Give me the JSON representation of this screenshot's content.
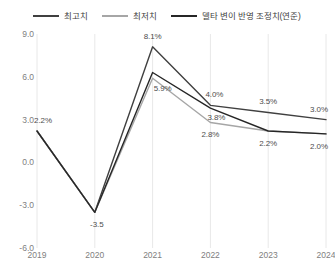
{
  "legend": {
    "position": "top-center",
    "items": [
      {
        "label": "최고치",
        "color": "#404040",
        "key": "high"
      },
      {
        "label": "최저치",
        "color": "#a6a6a6",
        "key": "low"
      },
      {
        "label": "델타 변이 반영 조정치(연준)",
        "color": "#262626",
        "key": "delta_adjusted"
      }
    ]
  },
  "axes": {
    "y_ticks": [
      "9.0",
      "6.0",
      "3.0",
      "0.0",
      "-3.0",
      "-6.0"
    ],
    "y_values": [
      9,
      6,
      3,
      0,
      -3,
      -6
    ],
    "x_ticks": [
      "2019",
      "2020",
      "2021",
      "2022",
      "2023",
      "2024"
    ]
  },
  "annotations": [
    {
      "text": "2.2%",
      "x": 2019,
      "y": 2.2,
      "dx": 6,
      "dy": -11
    },
    {
      "text": "-3.5",
      "x": 2020,
      "y": -3.5,
      "dx": 2,
      "dy": 12
    },
    {
      "text": "8.1%",
      "x": 2021,
      "y": 8.1,
      "dx": 0,
      "dy": -11
    },
    {
      "text": "5.9%",
      "x": 2021,
      "y": 5.9,
      "dx": 10,
      "dy": 10
    },
    {
      "text": "4.0%",
      "x": 2022,
      "y": 4.0,
      "dx": 4,
      "dy": -11
    },
    {
      "text": "3.8%",
      "x": 2022,
      "y": 3.8,
      "dx": 6,
      "dy": 9
    },
    {
      "text": "2.8%",
      "x": 2022,
      "y": 2.8,
      "dx": 0,
      "dy": 12
    },
    {
      "text": "3.5%",
      "x": 2023,
      "y": 3.5,
      "dx": 0,
      "dy": -11
    },
    {
      "text": "2.2%",
      "x": 2023,
      "y": 2.2,
      "dx": 0,
      "dy": 12
    },
    {
      "text": "3.0%",
      "x": 2024,
      "y": 3.0,
      "dx": -7,
      "dy": -11
    },
    {
      "text": "2.0%",
      "x": 2024,
      "y": 2.0,
      "dx": -7,
      "dy": 12
    }
  ],
  "chart_data": {
    "type": "line",
    "title": "",
    "subtitle": "",
    "xlabel": "",
    "ylabel": "",
    "categories": [
      "2019",
      "2020",
      "2021",
      "2022",
      "2023",
      "2024"
    ],
    "x": [
      2019,
      2020,
      2021,
      2022,
      2023,
      2024
    ],
    "ylim": [
      -6,
      9
    ],
    "xlim": [
      2019,
      2024
    ],
    "grid": true,
    "grid_axis": "x",
    "legend_position": "top-center",
    "series": [
      {
        "name": "최고치",
        "color": "#404040",
        "values": [
          2.2,
          -3.5,
          8.1,
          4.0,
          3.5,
          3.0
        ]
      },
      {
        "name": "최저치",
        "color": "#a6a6a6",
        "values": [
          2.2,
          -3.5,
          5.9,
          2.8,
          2.2,
          2.0
        ]
      },
      {
        "name": "델타 변이 반영 조정치(연준)",
        "color": "#262626",
        "values": [
          2.2,
          -3.5,
          6.3,
          3.8,
          2.2,
          2.0
        ]
      }
    ]
  }
}
